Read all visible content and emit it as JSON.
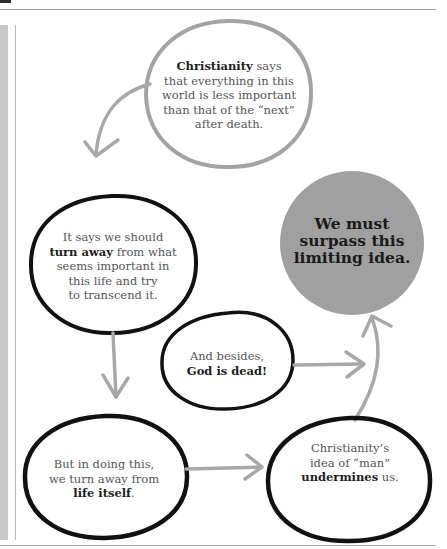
{
  "diagram": {
    "colors": {
      "gray_stroke": "#a3a3a3",
      "black_stroke": "#111111",
      "conclusion_fill": "#a0a0a0",
      "arrow_gray": "#a8a8a8"
    },
    "nodes": [
      {
        "id": "christianity-says",
        "style": "gray-outline",
        "lines": [
          {
            "bold": "Christianity",
            "rest": " says"
          },
          {
            "text": "that everything in this"
          },
          {
            "text": "world is less important"
          },
          {
            "text": "than that of the “next”"
          },
          {
            "text": "after death."
          }
        ]
      },
      {
        "id": "turn-away",
        "style": "black-outline",
        "lines": [
          {
            "text": "It says we should"
          },
          {
            "bold": "turn away",
            "rest": " from what"
          },
          {
            "text": "seems important in"
          },
          {
            "text": "this life and try"
          },
          {
            "text": "to transcend it."
          }
        ]
      },
      {
        "id": "god-is-dead",
        "style": "black-outline",
        "lines": [
          {
            "text": "And besides,"
          },
          {
            "bold": "God is dead!"
          }
        ]
      },
      {
        "id": "life-itself",
        "style": "black-outline",
        "lines": [
          {
            "text": "But in doing this,"
          },
          {
            "text": "we turn away from"
          },
          {
            "bold": "life itself",
            "rest": "."
          }
        ]
      },
      {
        "id": "undermines",
        "style": "black-outline",
        "lines": [
          {
            "text": "Christianity’s"
          },
          {
            "text": "idea of “man”"
          },
          {
            "bold": "undermines",
            "rest": " us."
          }
        ]
      },
      {
        "id": "conclusion",
        "style": "gray-filled",
        "lines": [
          {
            "text": "We must"
          },
          {
            "text": "surpass this"
          },
          {
            "text": "limiting idea."
          }
        ]
      }
    ],
    "arrows": [
      {
        "from": "christianity-says",
        "to": "turn-away"
      },
      {
        "from": "turn-away",
        "to": "life-itself"
      },
      {
        "from": "life-itself",
        "to": "undermines"
      },
      {
        "from": "god-is-dead",
        "to": "conclusion"
      },
      {
        "from": "undermines",
        "to": "conclusion"
      }
    ]
  }
}
